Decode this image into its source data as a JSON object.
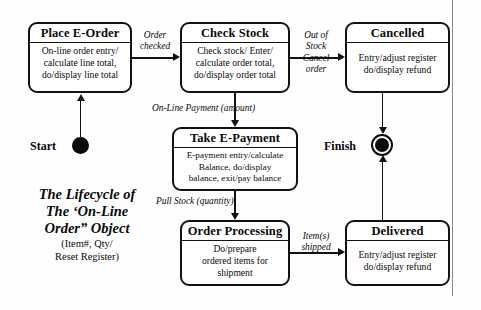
{
  "diagram": {
    "caption": {
      "title_lines": [
        "The Lifecycle of",
        "The ‘On-Line",
        "Order” Object"
      ],
      "subtitle_lines": [
        "(Item#, Qty/",
        "Reset Register)"
      ]
    },
    "markers": {
      "start_label": "Start",
      "finish_label": "Finish"
    },
    "states": [
      {
        "id": "place-e-order",
        "title": "Place E-Order",
        "body_lines": [
          "On-line order entry/",
          "calculate line total,",
          "do/display line total"
        ]
      },
      {
        "id": "check-stock",
        "title": "Check Stock",
        "body_lines": [
          "Check stock/ Enter/",
          "calculate order total,",
          "do/display order total"
        ]
      },
      {
        "id": "cancelled",
        "title": "Cancelled",
        "body_lines": [
          "Entry/adjust register",
          "do/display refund"
        ]
      },
      {
        "id": "take-e-payment",
        "title": "Take E-Payment",
        "body_lines": [
          "E-payment entry/calculate",
          "Balance, do/display",
          "balance, exit/pay balance"
        ]
      },
      {
        "id": "order-processing",
        "title": "Order Processing",
        "body_lines": [
          "Do/prepare",
          "ordered items for",
          "shipment"
        ]
      },
      {
        "id": "delivered",
        "title": "Delivered",
        "body_lines": [
          "Entry/adjust register",
          "do/display refund"
        ]
      }
    ],
    "transitions": [
      {
        "id": "order-checked",
        "lines": [
          "Order",
          "checked"
        ]
      },
      {
        "id": "out-of-stock",
        "lines": [
          "Out of",
          "Stock",
          "Cancel",
          "order"
        ]
      },
      {
        "id": "on-line-payment",
        "lines": [
          "On-Line Payment (amount)"
        ]
      },
      {
        "id": "pull-stock",
        "lines": [
          "Pull Stock (quantity)"
        ]
      },
      {
        "id": "items-shipped",
        "lines": [
          "Item(s)",
          "shipped"
        ]
      }
    ]
  },
  "colors": {
    "ink": "#121212",
    "paper": "#fefefe",
    "rule": "#8a8a8a"
  }
}
